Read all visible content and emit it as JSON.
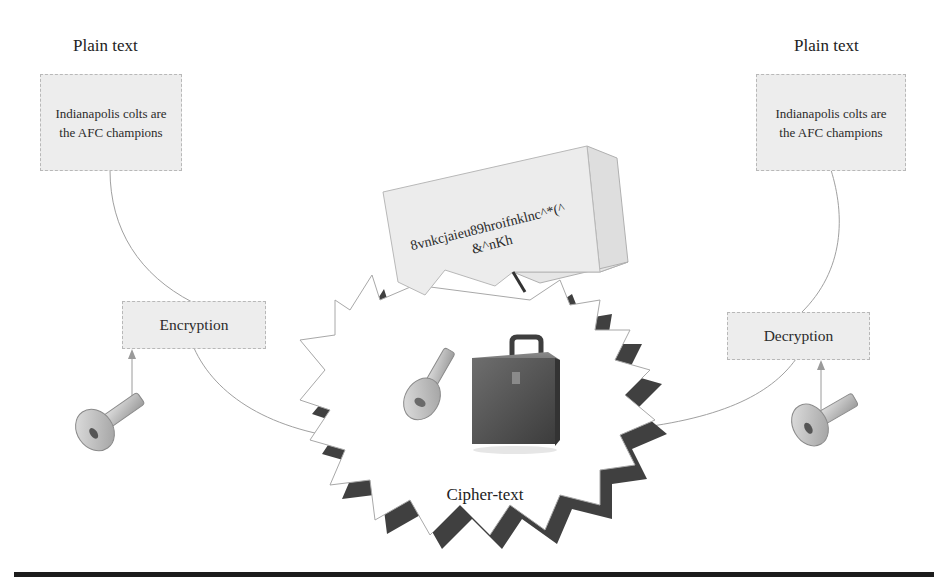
{
  "diagram": {
    "left": {
      "heading": "Plain text",
      "plaintext_box": {
        "line1": "Indianapolis colts are",
        "line2": "the AFC champions"
      },
      "operation_box": "Encryption",
      "key_icon": "key-icon"
    },
    "right": {
      "heading": "Plain text",
      "plaintext_box": {
        "line1": "Indianapolis colts are",
        "line2": "the AFC champions"
      },
      "operation_box": "Decryption",
      "key_icon": "key-icon"
    },
    "center": {
      "ciphertext_card": {
        "line1": "8vnkcjaieu89hroifnklnc^*(^",
        "line2": "&^nKh"
      },
      "burst_label": "Cipher-text",
      "icons": [
        "key-icon",
        "lockbox-icon",
        "burst-shape"
      ]
    },
    "colors": {
      "box_fill": "#ededed",
      "box_border": "#b8b8b8",
      "connector": "#9a9a9a",
      "burst_shadow": "#3f3f3f",
      "lockbox": "#5a5a5a",
      "key": "#c9c9c9",
      "rule": "#1c1c1c"
    }
  }
}
